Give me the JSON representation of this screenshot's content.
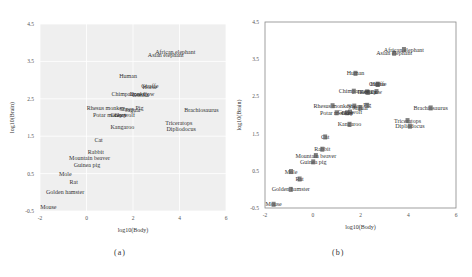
{
  "figures": [
    {
      "id": "a",
      "caption": "(a)",
      "xlabel": "log10(Body)",
      "ylabel": "log10(Brain)",
      "style": "gray-grid"
    },
    {
      "id": "b",
      "caption": "(b)",
      "xlabel": "log10(Body)",
      "ylabel": "log10(Brain)",
      "style": "boxed-with-markers"
    }
  ],
  "chart_data": [
    {
      "type": "scatter",
      "title": "",
      "panel": "(a)",
      "xlabel": "log10(Body)",
      "ylabel": "log10(Brain)",
      "xlim": [
        -2,
        6
      ],
      "ylim": [
        -0.5,
        4.5
      ],
      "xticks": [
        -2,
        0,
        2,
        4,
        6
      ],
      "yticks": [
        -0.5,
        0.5,
        1.5,
        2.5,
        3.5,
        4.5
      ],
      "grid": true,
      "background": "#efefef",
      "markers": false,
      "points": [
        {
          "label": "Mountain beaver",
          "x": 0.13,
          "y": 0.91
        },
        {
          "label": "Cow",
          "x": 2.67,
          "y": 2.63
        },
        {
          "label": "Grey wolf",
          "x": 1.56,
          "y": 2.08
        },
        {
          "label": "Goat",
          "x": 1.44,
          "y": 2.06
        },
        {
          "label": "Guinea pig",
          "x": 0.02,
          "y": 0.74
        },
        {
          "label": "Dipliodocus",
          "x": 4.07,
          "y": 1.7
        },
        {
          "label": "Asian elephant",
          "x": 3.41,
          "y": 3.66
        },
        {
          "label": "Donkey",
          "x": 2.27,
          "y": 2.62
        },
        {
          "label": "Horse",
          "x": 2.72,
          "y": 2.82
        },
        {
          "label": "Potar monkey",
          "x": 1.0,
          "y": 2.06
        },
        {
          "label": "Cat",
          "x": 0.52,
          "y": 1.41
        },
        {
          "label": "Giraffe",
          "x": 2.72,
          "y": 2.83
        },
        {
          "label": "Gorilla",
          "x": 2.32,
          "y": 2.61
        },
        {
          "label": "Human",
          "x": 1.79,
          "y": 3.12
        },
        {
          "label": "African elephant",
          "x": 3.82,
          "y": 3.76
        },
        {
          "label": "Triceratops",
          "x": 3.97,
          "y": 1.85
        },
        {
          "label": "Rhesus monkey",
          "x": 0.83,
          "y": 2.25
        },
        {
          "label": "Kangaroo",
          "x": 1.54,
          "y": 1.75
        },
        {
          "label": "Golden hamster",
          "x": -0.92,
          "y": 0.0
        },
        {
          "label": "Mouse",
          "x": -1.64,
          "y": -0.4
        },
        {
          "label": "Rabbit",
          "x": 0.4,
          "y": 1.08
        },
        {
          "label": "Sheep",
          "x": 1.74,
          "y": 2.24
        },
        {
          "label": "Jaguar",
          "x": 2.0,
          "y": 2.2
        },
        {
          "label": "Chimpanzee",
          "x": 1.72,
          "y": 2.64
        },
        {
          "label": "Rat",
          "x": -0.55,
          "y": 0.28
        },
        {
          "label": "Brachiosaurus",
          "x": 4.94,
          "y": 2.19
        },
        {
          "label": "Mole",
          "x": -0.91,
          "y": 0.48
        },
        {
          "label": "Pig",
          "x": 2.28,
          "y": 2.26
        }
      ]
    },
    {
      "type": "scatter",
      "title": "",
      "panel": "(b)",
      "xlabel": "log10(Body)",
      "ylabel": "log10(Brain)",
      "xlim": [
        -2,
        6
      ],
      "ylim": [
        -0.5,
        4.5
      ],
      "xticks": [
        -2,
        0,
        2,
        4,
        6
      ],
      "yticks": [
        -0.5,
        0.5,
        1.5,
        2.5,
        3.5,
        4.5
      ],
      "grid": false,
      "background": "#ffffff",
      "markers": true,
      "points_same_as": "(a)"
    }
  ]
}
